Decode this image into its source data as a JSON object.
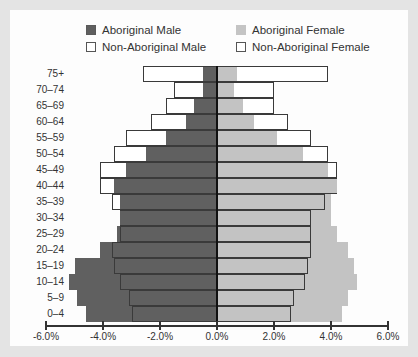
{
  "chart_data": {
    "type": "bar",
    "subtype": "population-pyramid",
    "title": "",
    "xlabel": "",
    "ylabel": "",
    "xlim": [
      -6.0,
      6.0
    ],
    "x_ticks": [
      "-6.0%",
      "-4.0%",
      "-2.0%",
      "0.0%",
      "2.0%",
      "4.0%",
      "6.0%"
    ],
    "grid": false,
    "legend_position": "top",
    "categories": [
      "75+",
      "70–74",
      "65–69",
      "60–64",
      "55–59",
      "50–54",
      "45–49",
      "40–44",
      "35–39",
      "30–34",
      "25–29",
      "20–24",
      "15–19",
      "10–14",
      "5–9",
      "0–4"
    ],
    "series": [
      {
        "name": "Aboriginal Male",
        "side": "left",
        "style": "filled-dark",
        "color": "#606060",
        "values": [
          0.5,
          0.5,
          0.8,
          1.1,
          1.8,
          2.5,
          3.2,
          3.6,
          3.4,
          3.4,
          3.5,
          4.1,
          5.0,
          5.2,
          4.9,
          4.6
        ]
      },
      {
        "name": "Non-Aboriginal Male",
        "side": "left",
        "style": "outline",
        "values": [
          2.6,
          1.5,
          1.8,
          2.3,
          3.2,
          3.6,
          4.1,
          4.1,
          3.7,
          3.4,
          3.4,
          3.7,
          3.6,
          3.4,
          3.1,
          3.0
        ]
      },
      {
        "name": "Aboriginal Female",
        "side": "right",
        "style": "filled-light",
        "color": "#c3c3c3",
        "values": [
          0.7,
          0.6,
          0.9,
          1.3,
          2.1,
          3.0,
          3.9,
          4.2,
          4.0,
          4.0,
          4.2,
          4.6,
          4.8,
          4.9,
          4.6,
          4.4
        ]
      },
      {
        "name": "Non-Aboriginal Female",
        "side": "right",
        "style": "outline",
        "values": [
          3.9,
          2.0,
          2.0,
          2.5,
          3.3,
          3.9,
          4.2,
          4.2,
          3.8,
          3.3,
          3.3,
          3.3,
          3.2,
          3.1,
          2.7,
          2.6
        ]
      }
    ]
  },
  "legend": {
    "ab_male": "Aboriginal Male",
    "non_male": "Non-Aboriginal Male",
    "ab_female": "Aboriginal Female",
    "non_female": "Non-Aboriginal Female"
  }
}
